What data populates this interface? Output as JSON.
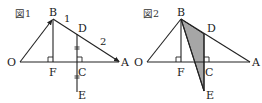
{
  "figures": [
    {
      "title": "図1",
      "points": {
        "B": "B",
        "D": "D",
        "O": "O",
        "F": "F",
        "C": "C",
        "A": "A",
        "E": "E"
      },
      "segment_labels": {
        "BD": "1",
        "DA": "2"
      },
      "notes": "Arrows on BO toward B and on OA/BA toward A; DE perpendicular to OA at C with equal tick marks on DC and CE; BF perpendicular to OA at F"
    },
    {
      "title": "図2",
      "points": {
        "B": "B",
        "D": "D",
        "O": "O",
        "F": "F",
        "C": "C",
        "A": "A",
        "E": "E"
      },
      "shaded_region": "triangle B-D-E (shaded gray)",
      "colors": {
        "shade": "#a6a6a6",
        "line": "#222222"
      }
    }
  ]
}
